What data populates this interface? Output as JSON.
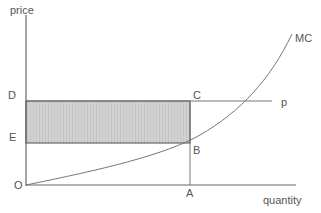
{
  "diagram": {
    "axes": {
      "y_label": "price",
      "x_label": "quantity",
      "origin_label": "O"
    },
    "points": {
      "D": "D",
      "E": "E",
      "C": "C",
      "B": "B",
      "A": "A"
    },
    "curves": {
      "mc": "MC",
      "price_line": "p"
    },
    "colors": {
      "axis": "#555555",
      "shade": "#cfcfcf",
      "text": "#555555"
    }
  }
}
